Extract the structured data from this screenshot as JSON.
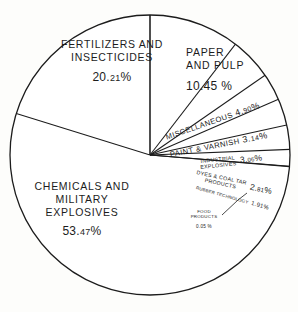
{
  "chart_data": {
    "type": "pie",
    "title": "",
    "subtitle": "",
    "xlabel": "",
    "ylabel": "",
    "legend_position": "none",
    "grid": false,
    "units": "percent",
    "start_angle_deg": 0,
    "direction": "clockwise",
    "categories": [
      "PAPER AND PULP",
      "MISCELLANEOUS",
      "PAINT & VARNISH",
      "INDUSTRIAL EXPLOSIVES",
      "DYES & COAL TAR PRODUCTS",
      "RUBBER TECHNOLOGY",
      "FOOD PRODUCTS",
      "CHEMICALS AND MILITARY EXPLOSIVES",
      "FERTILIZERS AND INSECTICIDES"
    ],
    "values": [
      10.45,
      4.9,
      3.14,
      3.06,
      2.81,
      1.91,
      0.05,
      53.47,
      20.21
    ],
    "slices": [
      {
        "label": "PAPER AND PULP",
        "value": 10.45,
        "pct_text": "10.45 %",
        "start_deg": 0.0,
        "end_deg": 37.62
      },
      {
        "label": "MISCELLANEOUS",
        "value": 4.9,
        "pct_text": "4.90 %",
        "start_deg": 37.62,
        "end_deg": 55.26
      },
      {
        "label": "PAINT & VARNISH",
        "value": 3.14,
        "pct_text": "3.14 %",
        "start_deg": 55.26,
        "end_deg": 66.56
      },
      {
        "label": "INDUSTRIAL EXPLOSIVES",
        "value": 3.06,
        "pct_text": "3.06 %",
        "start_deg": 66.56,
        "end_deg": 77.58
      },
      {
        "label": "DYES & COAL TAR PRODUCTS",
        "value": 2.81,
        "pct_text": "2.81 %",
        "start_deg": 77.58,
        "end_deg": 87.7
      },
      {
        "label": "RUBBER TECHNOLOGY",
        "value": 1.91,
        "pct_text": "1.91 %",
        "start_deg": 87.7,
        "end_deg": 94.58
      },
      {
        "label": "FOOD PRODUCTS",
        "value": 0.05,
        "pct_text": "0.05 %",
        "start_deg": 94.58,
        "end_deg": 94.76
      },
      {
        "label": "CHEMICALS AND MILITARY EXPLOSIVES",
        "value": 53.47,
        "pct_text": "53.47%",
        "start_deg": 94.76,
        "end_deg": 287.25
      },
      {
        "label": "FERTILIZERS AND INSECTICIDES",
        "value": 20.21,
        "pct_text": "20.21 %",
        "start_deg": 287.25,
        "end_deg": 360.0
      }
    ],
    "colors": {
      "slice_fill": "#ffffff",
      "outline": "#1c1c1c",
      "text": "#1c1c1c",
      "background": "#fdfdfb"
    }
  },
  "labels": {
    "fertilizers": {
      "line1": "FERTILIZERS AND",
      "line2": "INSECTICIDES",
      "pct_int": "20.",
      "pct_dec": "21",
      "pct_sym": "%"
    },
    "paper": {
      "line1": "PAPER",
      "line2": "AND PULP",
      "pct": "10.45 %"
    },
    "chemicals": {
      "line1": "CHEMICALS AND",
      "line2": "MILITARY",
      "line3": "EXPLOSIVES",
      "pct_int": "53.",
      "pct_dec": "47",
      "pct_sym": "%"
    },
    "miscellaneous": {
      "name": "MISCELLANEOUS",
      "pct_int": "4.",
      "pct_dec": "90",
      "pct_sym": "%"
    },
    "paint": {
      "name": "PAINT & VARNISH",
      "pct_int": "3.",
      "pct_dec": "14",
      "pct_sym": "%"
    },
    "industrial": {
      "line1": "INDUSTRIAL",
      "line2": "EXPLOSIVES",
      "pct_int": "3.",
      "pct_dec": "06",
      "pct_sym": "%"
    },
    "dyes": {
      "line1": "DYES & COAL TAR",
      "line2": "PRODUCTS",
      "pct_int": "2.",
      "pct_dec": "81",
      "pct_sym": "%"
    },
    "rubber": {
      "name": "RUBBER TECHNOLOGY",
      "pct_int": "1.",
      "pct_dec": "91",
      "pct_sym": "%"
    },
    "food": {
      "line1": "FOOD",
      "line2": "PRODUCTS",
      "pct": "0.05 %"
    }
  }
}
